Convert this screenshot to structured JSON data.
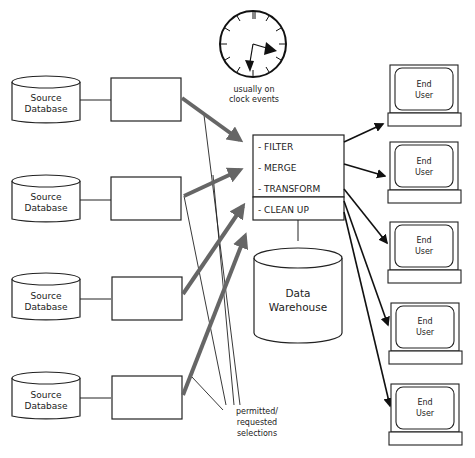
{
  "diagram": {
    "sources": [
      {
        "line1": "Source",
        "line2": "Database"
      },
      {
        "line1": "Source",
        "line2": "Database"
      },
      {
        "line1": "Source",
        "line2": "Database"
      },
      {
        "line1": "Source",
        "line2": "Database"
      }
    ],
    "clock": {
      "label_line1": "usually on",
      "label_line2": "clock events",
      "icon": "clock-icon"
    },
    "process": {
      "steps": [
        "- FILTER",
        "- MERGE",
        "- TRANSFORM",
        "- CLEAN UP"
      ]
    },
    "warehouse": {
      "line1": "Data",
      "line2": "Warehouse"
    },
    "end_users": [
      {
        "line1": "End",
        "line2": "User"
      },
      {
        "line1": "End",
        "line2": "User"
      },
      {
        "line1": "End",
        "line2": "User"
      },
      {
        "line1": "End",
        "line2": "User"
      },
      {
        "line1": "End",
        "line2": "User"
      }
    ],
    "selections_note": {
      "line1": "permitted/",
      "line2": "requested",
      "line3": "selections"
    },
    "colors": {
      "thick_arrow": "#666666",
      "line": "#111111"
    }
  }
}
